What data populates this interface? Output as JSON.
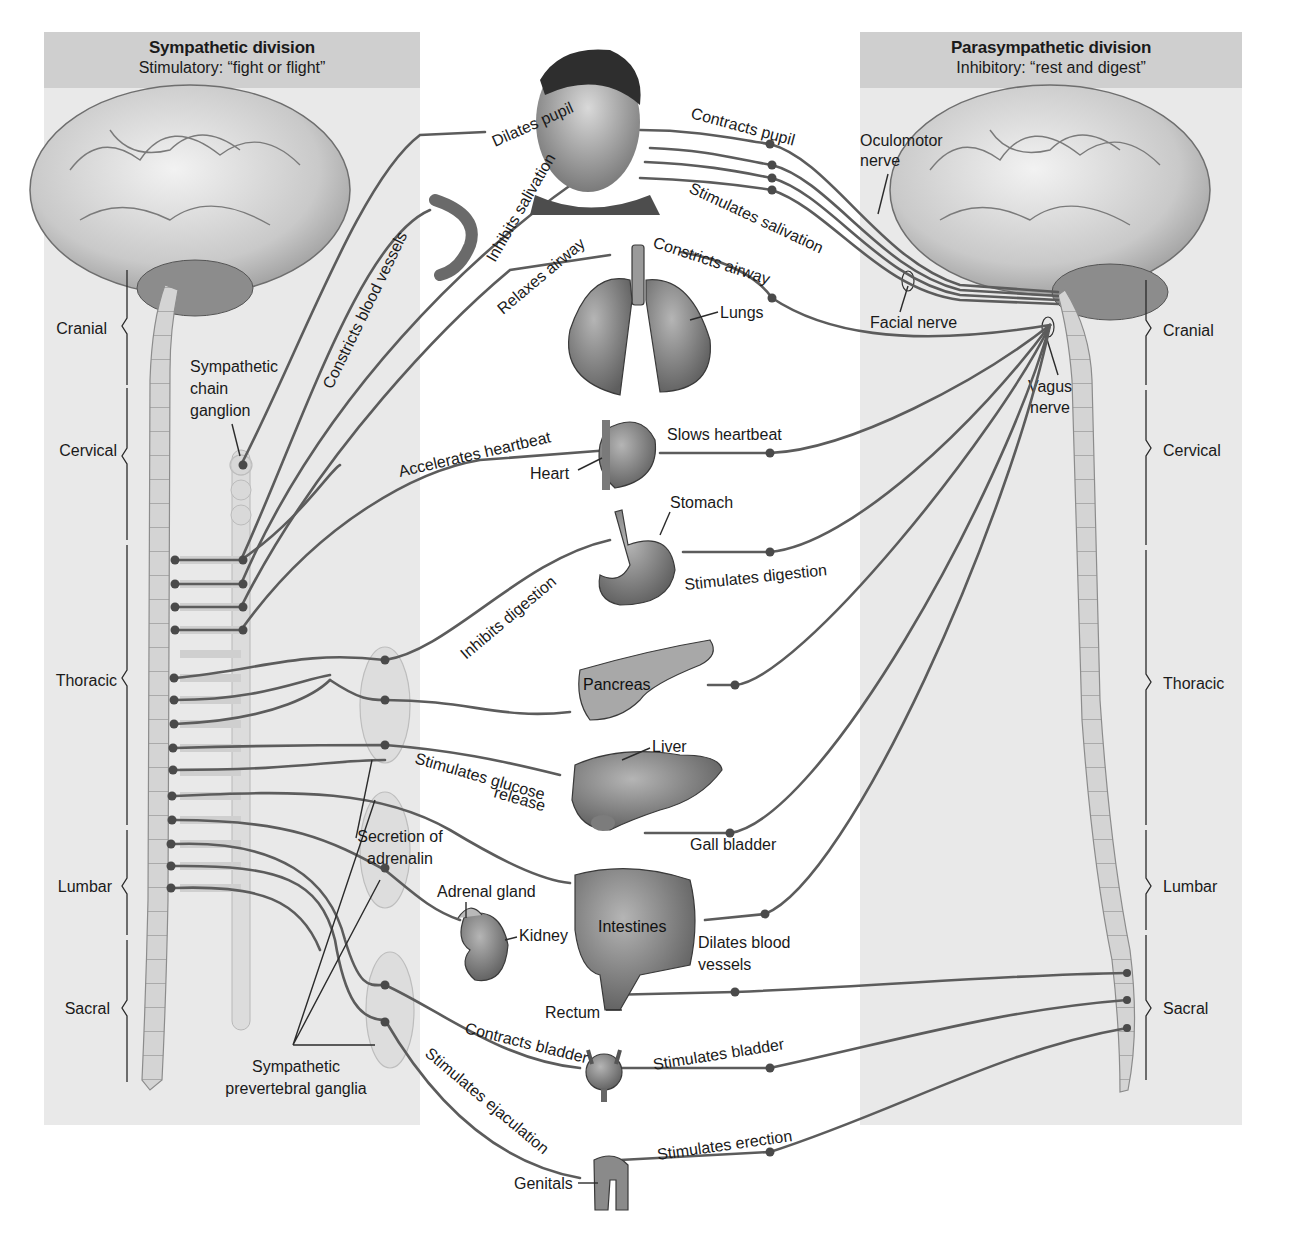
{
  "sympathetic": {
    "title": "Sympathetic division",
    "subtitle": "Stimulatory: “fight or flight”"
  },
  "parasympathetic": {
    "title": "Parasympathetic division",
    "subtitle": "Inhibitory: “rest and digest”"
  },
  "spinal_regions": {
    "left": [
      "Cranial",
      "Cervical",
      "Thoracic",
      "Lumbar",
      "Sacral"
    ],
    "right": [
      "Cranial",
      "Cervical",
      "Thoracic",
      "Lumbar",
      "Sacral"
    ]
  },
  "structure_labels": {
    "sympathetic_chain_ganglion": [
      "Sympathetic",
      "chain",
      "ganglion"
    ],
    "prevertebral_ganglia": [
      "Sympathetic",
      "prevertebral ganglia"
    ],
    "secretion_of_adrenalin": [
      "Secretion of",
      "adrenalin"
    ],
    "oculomotor_nerve": [
      "Oculomotor",
      "nerve"
    ],
    "facial_nerve": "Facial nerve",
    "vagus_nerve": [
      "Vagus",
      "nerve"
    ]
  },
  "organs": {
    "lungs": "Lungs",
    "heart": "Heart",
    "stomach": "Stomach",
    "pancreas": "Pancreas",
    "liver": "Liver",
    "gall_bladder": "Gall bladder",
    "adrenal_gland": "Adrenal gland",
    "kidney": "Kidney",
    "intestines": "Intestines",
    "rectum": "Rectum",
    "genitals": "Genitals"
  },
  "sympathetic_effects": {
    "dilates_pupil": "Dilates pupil",
    "inhibits_salivation": "Inhibits salivation",
    "constricts_blood_vessels": "Constricts blood vessels",
    "relaxes_airway": "Relaxes airway",
    "accelerates_heartbeat": "Accelerates heartbeat",
    "inhibits_digestion": "Inhibits digestion",
    "stimulates_glucose_release": [
      "Stimulates glucose",
      "release"
    ],
    "contracts_bladder": "Contracts bladder",
    "stimulates_ejaculation": "Stimulates ejaculation"
  },
  "parasympathetic_effects": {
    "contracts_pupil": "Contracts pupil",
    "stimulates_salivation": "Stimulates salivation",
    "constricts_airway": "Constricts airway",
    "slows_heartbeat": "Slows heartbeat",
    "stimulates_digestion": "Stimulates digestion",
    "dilates_blood_vessels": [
      "Dilates blood",
      "vessels"
    ],
    "stimulates_bladder": "Stimulates bladder",
    "stimulates_erection": "Stimulates erection"
  },
  "colors": {
    "panel_bg": "#e9e9e9",
    "panel_header_bg": "#cfcfcf",
    "nerve": "#5c5c5c",
    "organ_fill": "#8a8a8a",
    "spine_fill": "#d4d4d4"
  }
}
